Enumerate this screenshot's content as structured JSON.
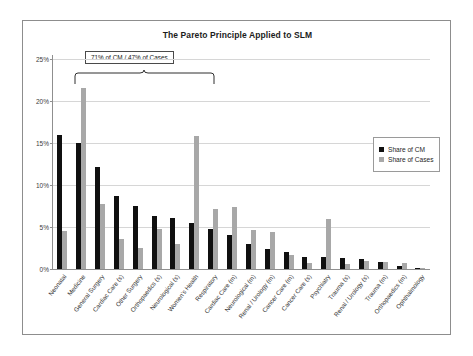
{
  "chart_data": {
    "type": "bar",
    "title": "The Pareto Principle Applied to SLM",
    "xlabel": "",
    "ylabel": "",
    "ylim": [
      0,
      25
    ],
    "ytick_labels": [
      "0%",
      "5%",
      "10%",
      "15%",
      "20%",
      "25%"
    ],
    "ytick_values": [
      0,
      5,
      10,
      15,
      20,
      25
    ],
    "grid": true,
    "legend_position": "right",
    "categories": [
      "Neonatal",
      "Medicine",
      "General Surgery",
      "Cardiac Care (s)",
      "Other Surgery",
      "Orthopaedics (s)",
      "Neurological (s)",
      "Women's Health",
      "Respiratory",
      "Cardiac Care (m)",
      "Neurological (m)",
      "Renal / Urology (m)",
      "Cancer Care (m)",
      "Cancer Care (s)",
      "Psychiatry",
      "Trauma (s)",
      "Renal / Urology (s)",
      "Trauma (m)",
      "Orthopaedics (m)",
      "Ophthalmology"
    ],
    "series": [
      {
        "name": "Share of CM",
        "color": "#101010",
        "values": [
          15.9,
          15.0,
          12.2,
          8.7,
          7.5,
          6.3,
          6.1,
          5.5,
          4.8,
          4.0,
          3.0,
          2.4,
          2.0,
          1.4,
          1.4,
          1.3,
          1.2,
          0.8,
          0.3,
          0.05
        ]
      },
      {
        "name": "Share of Cases",
        "color": "#a8a8a8",
        "values": [
          4.5,
          21.6,
          7.7,
          3.6,
          2.5,
          4.8,
          3.0,
          15.8,
          7.2,
          7.4,
          4.7,
          4.4,
          1.7,
          0.7,
          6.0,
          0.6,
          1.0,
          0.8,
          0.7,
          0.1
        ]
      }
    ],
    "annotation": {
      "text": "71% of CM / 47% of Cases",
      "spans_categories": [
        "Neonatal",
        "Women's Health"
      ]
    }
  },
  "legend": {
    "items": [
      {
        "label": "Share of CM"
      },
      {
        "label": "Share of Cases"
      }
    ]
  }
}
